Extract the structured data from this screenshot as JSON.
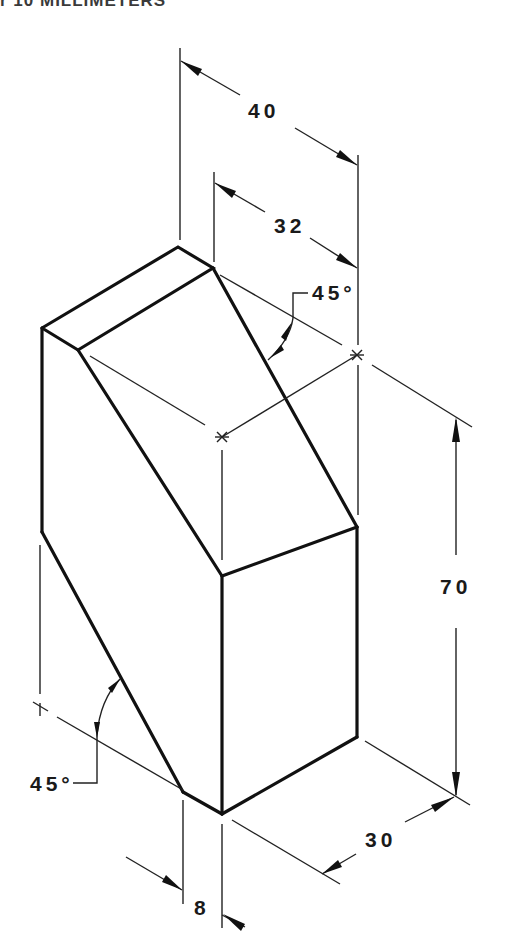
{
  "header": {
    "text": "r 10 MILLIMETERS"
  },
  "drawing": {
    "type": "isometric-dimensioned-block",
    "dimensions": {
      "overall_width": "40",
      "top_width": "32",
      "height": "70",
      "depth": "30",
      "offset": "8",
      "angle_top": "45°",
      "angle_bottom": "45°"
    }
  }
}
